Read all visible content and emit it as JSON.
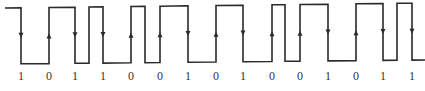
{
  "diagram": {
    "type": "digital-waveform",
    "encoding_note": "Manchester-style waveform with arrowed transitions at bit centers",
    "bits": [
      "1",
      "0",
      "1",
      "1",
      "0",
      "0",
      "1",
      "0",
      "1",
      "0",
      "0",
      "1",
      "0",
      "1",
      "1"
    ],
    "bit_centers_x": [
      21,
      49,
      75,
      103,
      131,
      160,
      188,
      216,
      243,
      272,
      300,
      328,
      356,
      383,
      412
    ],
    "transition_directions": [
      "down",
      "up",
      "down",
      "down",
      "up",
      "up",
      "down",
      "up",
      "down",
      "up",
      "up",
      "down",
      "up",
      "down",
      "down"
    ],
    "extra_edges_x": [
      89,
      145,
      285,
      397
    ],
    "levels": {
      "high_y": [
        8,
        3
      ],
      "low_y": [
        64,
        60
      ]
    },
    "start_x": 5,
    "end_x": 425,
    "label_y": 80,
    "colors": {
      "line": "#2a2a2a",
      "label": "#333333",
      "background": "#ffffff"
    }
  }
}
